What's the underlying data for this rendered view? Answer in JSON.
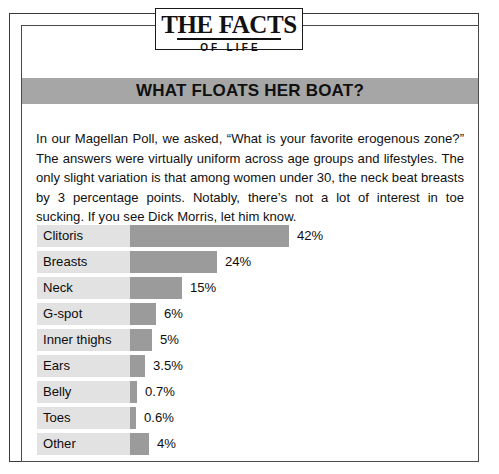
{
  "logo": {
    "main": "THE FACTS",
    "sub": "OF LIFE"
  },
  "heading": {
    "title": "WHAT FLOATS HER BOAT?"
  },
  "body": {
    "paragraph": "In our Magellan Poll, we asked, “What is your favorite erogenous zone?” The answers were virtually uniform across age groups and lifestyles. The only slight variation is that among women under 30, the neck beat breasts by 3 percentage points. Notably, there’s not a lot of interest in toe sucking. If you see Dick Morris, let him know."
  },
  "colors": {
    "band": "#a6a6a6",
    "bar": "#9b9b9b",
    "track": "#e2e2e2",
    "frame": "#3b3b3b",
    "text": "#0d0d0d"
  },
  "chart_data": {
    "type": "bar",
    "title": "WHAT FLOATS HER BOAT?",
    "xlabel": "",
    "ylabel": "",
    "orientation": "horizontal",
    "grid": false,
    "legend": false,
    "xlim": [
      0,
      42
    ],
    "categories": [
      "Clitoris",
      "Breasts",
      "Neck",
      "G-spot",
      "Inner thighs",
      "Ears",
      "Belly",
      "Toes",
      "Other"
    ],
    "values": [
      42,
      24,
      15,
      6,
      5,
      3.5,
      0.7,
      0.6,
      4
    ],
    "value_labels": [
      "42%",
      "24%",
      "15%",
      "6%",
      "5%",
      "3.5%",
      "0.7%",
      "0.6%",
      "4%"
    ],
    "bar_pixel_widths": [
      159,
      87,
      52,
      26,
      22,
      15,
      7,
      6,
      19
    ]
  }
}
